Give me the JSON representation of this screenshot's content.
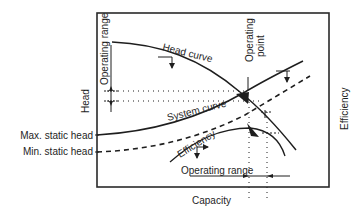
{
  "diagram": {
    "type": "pump performance curve",
    "axes": {
      "x_label": "Capacity",
      "y_label_left": "Head",
      "y_label_right": "Efficiency"
    },
    "left_markers": {
      "max_static_head": "Max. static head",
      "min_static_head": "Min. static head"
    },
    "curves": {
      "head_curve": "Head curve",
      "system_curve": "System curve",
      "efficiency": "Efficiency"
    },
    "annotations": {
      "operating_point_line1": "Operating",
      "operating_point_line2": "point",
      "operating_range_vertical": "Operating range",
      "operating_range_horizontal": "Operating range"
    },
    "colors": {
      "ink": "#1e1e1e",
      "background": "#ffffff",
      "frame": "#2a2a2a"
    }
  }
}
